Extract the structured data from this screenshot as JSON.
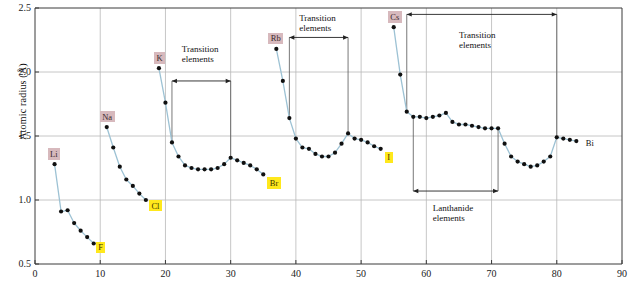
{
  "chart_data": {
    "type": "line",
    "title": "",
    "xlabel": "",
    "ylabel": "Atomic radius (Å)",
    "xlim": [
      0,
      90
    ],
    "ylim": [
      0.5,
      2.5
    ],
    "xticks": [
      0,
      10,
      20,
      30,
      40,
      50,
      60,
      70,
      80,
      90
    ],
    "yticks": [
      "0.5",
      "1.0",
      "1.5",
      "2.0",
      "2.5"
    ],
    "grid": true,
    "grid_x": [
      10,
      20,
      30,
      40,
      50,
      60,
      70,
      80
    ],
    "grid_y": [
      1.0,
      1.5,
      2.0
    ],
    "legend": "none",
    "marker_color": "#101010",
    "line_color": "#9dc2d4",
    "series": [
      {
        "name": "Period 2 (Li–F)",
        "x": [
          3,
          4,
          5,
          6,
          7,
          8,
          9
        ],
        "values": [
          1.28,
          0.91,
          0.92,
          0.82,
          0.76,
          0.71,
          0.66
        ]
      },
      {
        "name": "Period 3 (Na–Cl)",
        "x": [
          11,
          12,
          13,
          14,
          15,
          16,
          17
        ],
        "values": [
          1.57,
          1.41,
          1.26,
          1.16,
          1.11,
          1.05,
          1.0
        ]
      },
      {
        "name": "Period 4 (K–Br)",
        "x": [
          19,
          20,
          21,
          22,
          23,
          24,
          25,
          26,
          27,
          28,
          29,
          30,
          31,
          32,
          33,
          34,
          35
        ],
        "values": [
          2.03,
          1.76,
          1.45,
          1.34,
          1.27,
          1.25,
          1.24,
          1.24,
          1.24,
          1.25,
          1.28,
          1.33,
          1.31,
          1.29,
          1.27,
          1.24,
          1.2
        ]
      },
      {
        "name": "Period 5 (Rb–I)",
        "x": [
          37,
          38,
          39,
          40,
          41,
          42,
          43,
          44,
          45,
          46,
          47,
          48,
          49,
          50,
          51,
          52,
          53
        ],
        "values": [
          2.18,
          1.93,
          1.64,
          1.48,
          1.41,
          1.4,
          1.36,
          1.34,
          1.34,
          1.37,
          1.44,
          1.52,
          1.48,
          1.47,
          1.45,
          1.42,
          1.4
        ]
      },
      {
        "name": "Period 6 (Cs–Bi)",
        "x": [
          55,
          56,
          57,
          58,
          59,
          60,
          61,
          62,
          63,
          64,
          65,
          66,
          67,
          68,
          69,
          70,
          71,
          72,
          73,
          74,
          75,
          76,
          77,
          78,
          79,
          80,
          81,
          82,
          83
        ],
        "values": [
          2.35,
          1.98,
          1.69,
          1.65,
          1.65,
          1.64,
          1.65,
          1.66,
          1.68,
          1.61,
          1.59,
          1.59,
          1.58,
          1.57,
          1.56,
          1.56,
          1.56,
          1.44,
          1.34,
          1.3,
          1.28,
          1.26,
          1.27,
          1.3,
          1.34,
          1.49,
          1.48,
          1.47,
          1.46
        ]
      }
    ],
    "point_labels": [
      {
        "text": "Li",
        "element_x": 3,
        "value": 1.28,
        "style": "alkali"
      },
      {
        "text": "F",
        "element_x": 9,
        "value": 0.66,
        "style": "halogen"
      },
      {
        "text": "Na",
        "element_x": 11,
        "value": 1.57,
        "style": "alkali"
      },
      {
        "text": "Cl",
        "element_x": 17,
        "value": 1.0,
        "style": "halogen"
      },
      {
        "text": "K",
        "element_x": 19,
        "value": 2.03,
        "style": "alkali"
      },
      {
        "text": "Br",
        "element_x": 35,
        "value": 1.2,
        "style": "halogen"
      },
      {
        "text": "Rb",
        "element_x": 37,
        "value": 2.18,
        "style": "alkali"
      },
      {
        "text": "I",
        "element_x": 53,
        "value": 1.4,
        "style": "halogen"
      },
      {
        "text": "Cs",
        "element_x": 55,
        "value": 2.35,
        "style": "alkali"
      },
      {
        "text": "Bi",
        "element_x": 83,
        "value": 1.46,
        "style": "plain"
      }
    ],
    "annotations": [
      {
        "id": "transition-4",
        "text_line1": "Transition",
        "text_line2": "elements",
        "from_x": 21,
        "to_x": 30,
        "bracket_y": 1.93,
        "text_anchor_x": 22.5,
        "text_y": 2.22
      },
      {
        "id": "transition-5",
        "text_line1": "Transition",
        "text_line2": "elements",
        "from_x": 39,
        "to_x": 48,
        "bracket_y": 2.27,
        "text_anchor_x": 40.5,
        "text_y": 2.46
      },
      {
        "id": "transition-6",
        "text_line1": "Transition",
        "text_line2": "elements",
        "from_x": 57,
        "to_x": 80,
        "bracket_y": 2.45,
        "text_anchor_x": 65,
        "text_y": 2.33
      },
      {
        "id": "lanthanide-6",
        "text_line1": "Lanthanide",
        "text_line2": "elements",
        "from_x": 58,
        "to_x": 71,
        "bracket_y": 1.07,
        "text_anchor_x": 61,
        "text_y": 0.98
      }
    ],
    "drop_lines": [
      {
        "x": 21,
        "from": 1.93,
        "to": 1.45
      },
      {
        "x": 30,
        "from": 1.93,
        "to": 1.33
      },
      {
        "x": 39,
        "from": 2.27,
        "to": 1.64
      },
      {
        "x": 48,
        "from": 2.27,
        "to": 1.52
      },
      {
        "x": 57,
        "from": 2.45,
        "to": 1.69
      },
      {
        "x": 80,
        "from": 2.45,
        "to": 1.49
      },
      {
        "x": 58,
        "from": 1.07,
        "to": 1.65
      },
      {
        "x": 71,
        "from": 1.07,
        "to": 1.56
      }
    ]
  }
}
